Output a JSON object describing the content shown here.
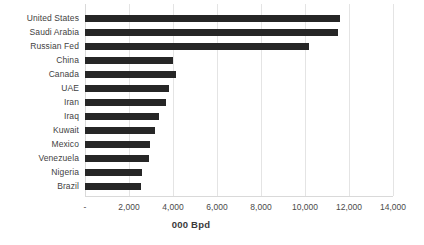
{
  "chart_data": {
    "type": "bar",
    "orientation": "horizontal",
    "title": "",
    "xlabel": "000 Bpd",
    "ylabel": "",
    "categories": [
      "United States",
      "Saudi Arabia",
      "Russian Fed",
      "China",
      "Canada",
      "UAE",
      "Iran",
      "Iraq",
      "Kuwait",
      "Mexico",
      "Venezuela",
      "Nigeria",
      "Brazil"
    ],
    "values": [
      11600,
      11480,
      10200,
      4000,
      4150,
      3800,
      3700,
      3350,
      3200,
      2950,
      2900,
      2600,
      2550
    ],
    "xlim": [
      0,
      14000
    ],
    "xticks": [
      0,
      2000,
      4000,
      6000,
      8000,
      10000,
      12000,
      14000
    ],
    "xtick_labels": [
      "-",
      "2,000",
      "4,000",
      "6,000",
      "8,000",
      "10,000",
      "12,000",
      "14,000"
    ],
    "grid": "vertical",
    "legend": "none",
    "bar_color": "#262626",
    "gridline_color": "#e4e4e4",
    "background_color": "#ffffff"
  }
}
